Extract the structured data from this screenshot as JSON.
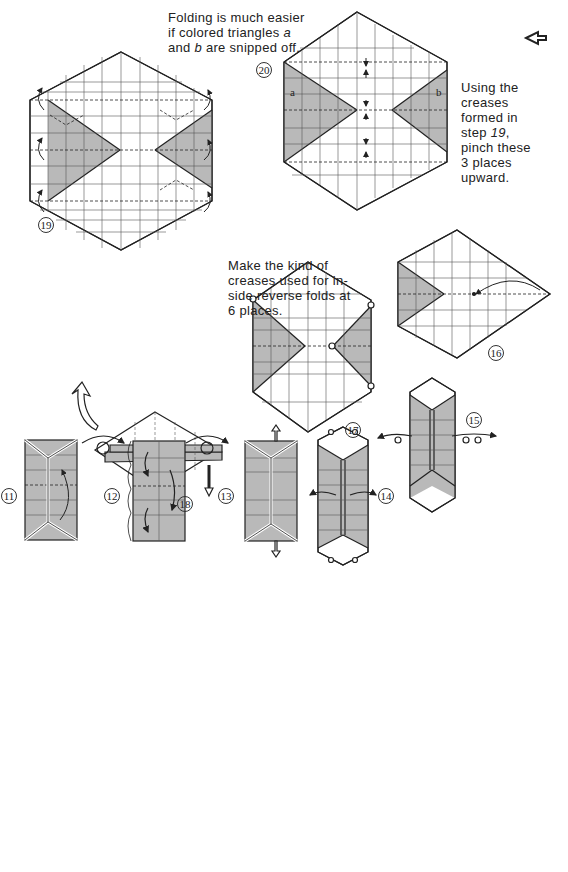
{
  "notes": {
    "snip": [
      "Folding is much easier",
      "if colored triangles ",
      "a",
      "",
      "and ",
      "b",
      " are snipped off."
    ],
    "pinch": [
      "Using the",
      "creases",
      "formed in",
      "step ",
      "19",
      ",",
      "pinch these",
      "3 places",
      "upward."
    ],
    "creases": [
      "Make the kind of",
      "creases used for in-",
      "side reverse folds at",
      "6 places."
    ]
  },
  "labels": {
    "a": "a",
    "b": "b"
  },
  "steps": {
    "s11": "11",
    "s12": "12",
    "s13": "13",
    "s14": "14",
    "s15": "15",
    "s16": "16",
    "s17": "17",
    "s18": "18",
    "s19": "19",
    "s20": "20"
  },
  "colors": {
    "shade": "#b9b9b9",
    "line": "#222222",
    "grid": "#555555"
  }
}
